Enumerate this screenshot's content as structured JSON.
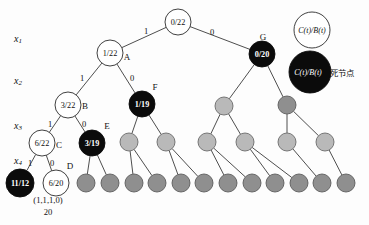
{
  "figure": {
    "axis_labels": [
      {
        "base": "x",
        "sub": "1",
        "x": 18,
        "y": 38
      },
      {
        "base": "x",
        "sub": "2",
        "x": 18,
        "y": 80
      },
      {
        "base": "x",
        "sub": "3",
        "x": 18,
        "y": 125
      },
      {
        "base": "x",
        "sub": "4",
        "x": 18,
        "y": 160
      }
    ],
    "caption_lines": [
      {
        "text": "(1,1,1,0)",
        "x": 48,
        "y": 200
      },
      {
        "text": "20",
        "x": 48,
        "y": 212
      }
    ],
    "legend": {
      "live_node": {
        "label": "C(t)/B(t)",
        "cx": 312,
        "cy": 30,
        "r": 18,
        "style": "white"
      },
      "dead_node": {
        "label": "C(t)/B(t)",
        "suffix": "死节点",
        "cx": 310,
        "cy": 72,
        "r": 21,
        "style": "black"
      }
    },
    "colors": {
      "white_node": "#ffffff",
      "black_node": "#0b0b0b",
      "gray_light": "#b9b9b9",
      "gray_dark": "#8f8f8f",
      "stroke": "#2b2b2b",
      "background": "#fdfdfd"
    }
  },
  "nodes": [
    {
      "id": "root",
      "label": "0/22",
      "tag": "",
      "style": "white",
      "cx": 178,
      "cy": 22,
      "r": 13,
      "tag_dx": 0,
      "tag_dy": 0
    },
    {
      "id": "A",
      "label": "1/22",
      "tag": "A",
      "style": "white",
      "cx": 110,
      "cy": 53,
      "r": 13,
      "tag_dx": 17,
      "tag_dy": 4
    },
    {
      "id": "G",
      "label": "0/20",
      "tag": "G",
      "style": "black",
      "cx": 262,
      "cy": 54,
      "r": 13,
      "tag_dx": 1,
      "tag_dy": -17
    },
    {
      "id": "B",
      "label": "3/22",
      "tag": "B",
      "style": "white",
      "cx": 68,
      "cy": 105,
      "r": 13,
      "tag_dx": 17,
      "tag_dy": 1
    },
    {
      "id": "F",
      "label": "1/19",
      "tag": "F",
      "style": "black",
      "cx": 142,
      "cy": 104,
      "r": 13,
      "tag_dx": 13,
      "tag_dy": -17
    },
    {
      "id": "g2a",
      "label": "",
      "tag": "",
      "style": "gray-light",
      "cx": 224,
      "cy": 106,
      "r": 9,
      "tag_dx": 0,
      "tag_dy": 0
    },
    {
      "id": "g2b",
      "label": "",
      "tag": "",
      "style": "gray-dark",
      "cx": 287,
      "cy": 105,
      "r": 9,
      "tag_dx": 0,
      "tag_dy": 0
    },
    {
      "id": "C",
      "label": "6/22",
      "tag": "C",
      "style": "white",
      "cx": 42,
      "cy": 143,
      "r": 13,
      "tag_dx": 17,
      "tag_dy": 2
    },
    {
      "id": "E",
      "label": "3/19",
      "tag": "E",
      "style": "black",
      "cx": 92,
      "cy": 143,
      "r": 13,
      "tag_dx": 15,
      "tag_dy": -17
    },
    {
      "id": "g3a",
      "label": "",
      "tag": "",
      "style": "gray-light",
      "cx": 129,
      "cy": 142,
      "r": 9,
      "tag_dx": 0,
      "tag_dy": 0
    },
    {
      "id": "g3b",
      "label": "",
      "tag": "",
      "style": "gray-light",
      "cx": 166,
      "cy": 142,
      "r": 9,
      "tag_dx": 0,
      "tag_dy": 0
    },
    {
      "id": "g3c",
      "label": "",
      "tag": "",
      "style": "gray-light",
      "cx": 207,
      "cy": 142,
      "r": 9,
      "tag_dx": 0,
      "tag_dy": 0
    },
    {
      "id": "g3d",
      "label": "",
      "tag": "",
      "style": "gray-light",
      "cx": 245,
      "cy": 142,
      "r": 9,
      "tag_dx": 0,
      "tag_dy": 0
    },
    {
      "id": "g3e",
      "label": "",
      "tag": "",
      "style": "gray-light",
      "cx": 287,
      "cy": 142,
      "r": 9,
      "tag_dx": 0,
      "tag_dy": 0
    },
    {
      "id": "g3f",
      "label": "",
      "tag": "",
      "style": "gray-light",
      "cx": 325,
      "cy": 142,
      "r": 9,
      "tag_dx": 0,
      "tag_dy": 0
    },
    {
      "id": "H",
      "label": "11/12",
      "tag": "",
      "style": "black",
      "cx": 20,
      "cy": 183,
      "r": 14,
      "tag_dx": 0,
      "tag_dy": 0
    },
    {
      "id": "D",
      "label": "6/20",
      "tag": "D",
      "style": "white",
      "cx": 56,
      "cy": 183,
      "r": 13,
      "tag_dx": 14,
      "tag_dy": -17
    },
    {
      "id": "l1",
      "label": "",
      "tag": "",
      "style": "gray-dark",
      "cx": 86,
      "cy": 183,
      "r": 9,
      "tag_dx": 0,
      "tag_dy": 0
    },
    {
      "id": "l2",
      "label": "",
      "tag": "",
      "style": "gray-dark",
      "cx": 110,
      "cy": 183,
      "r": 9,
      "tag_dx": 0,
      "tag_dy": 0
    },
    {
      "id": "l3",
      "label": "",
      "tag": "",
      "style": "gray-dark",
      "cx": 134,
      "cy": 183,
      "r": 9,
      "tag_dx": 0,
      "tag_dy": 0
    },
    {
      "id": "l4",
      "label": "",
      "tag": "",
      "style": "gray-dark",
      "cx": 157,
      "cy": 183,
      "r": 9,
      "tag_dx": 0,
      "tag_dy": 0
    },
    {
      "id": "l5",
      "label": "",
      "tag": "",
      "style": "gray-dark",
      "cx": 181,
      "cy": 183,
      "r": 9,
      "tag_dx": 0,
      "tag_dy": 0
    },
    {
      "id": "l6",
      "label": "",
      "tag": "",
      "style": "gray-dark",
      "cx": 204,
      "cy": 183,
      "r": 9,
      "tag_dx": 0,
      "tag_dy": 0
    },
    {
      "id": "l7",
      "label": "",
      "tag": "",
      "style": "gray-dark",
      "cx": 228,
      "cy": 183,
      "r": 9,
      "tag_dx": 0,
      "tag_dy": 0
    },
    {
      "id": "l8",
      "label": "",
      "tag": "",
      "style": "gray-dark",
      "cx": 252,
      "cy": 183,
      "r": 9,
      "tag_dx": 0,
      "tag_dy": 0
    },
    {
      "id": "l9",
      "label": "",
      "tag": "",
      "style": "gray-dark",
      "cx": 275,
      "cy": 183,
      "r": 9,
      "tag_dx": 0,
      "tag_dy": 0
    },
    {
      "id": "l10",
      "label": "",
      "tag": "",
      "style": "gray-dark",
      "cx": 299,
      "cy": 183,
      "r": 9,
      "tag_dx": 0,
      "tag_dy": 0
    },
    {
      "id": "l11",
      "label": "",
      "tag": "",
      "style": "gray-dark",
      "cx": 322,
      "cy": 183,
      "r": 9,
      "tag_dx": 0,
      "tag_dy": 0
    },
    {
      "id": "l12",
      "label": "",
      "tag": "",
      "style": "gray-dark",
      "cx": 346,
      "cy": 183,
      "r": 9,
      "tag_dx": 0,
      "tag_dy": 0
    }
  ],
  "edges": [
    {
      "from": "root",
      "to": "A",
      "label": "1",
      "lx": 146,
      "ly": 31
    },
    {
      "from": "root",
      "to": "G",
      "label": "0",
      "lx": 212,
      "ly": 32
    },
    {
      "from": "A",
      "to": "B",
      "label": "1",
      "lx": 82,
      "ly": 78
    },
    {
      "from": "A",
      "to": "F",
      "label": "0",
      "lx": 132,
      "ly": 78
    },
    {
      "from": "G",
      "to": "g2a",
      "label": "",
      "lx": 0,
      "ly": 0
    },
    {
      "from": "G",
      "to": "g2b",
      "label": "",
      "lx": 0,
      "ly": 0
    },
    {
      "from": "B",
      "to": "C",
      "label": "1",
      "lx": 50,
      "ly": 124
    },
    {
      "from": "B",
      "to": "E",
      "label": "0",
      "lx": 84,
      "ly": 124
    },
    {
      "from": "F",
      "to": "g3a",
      "label": "",
      "lx": 0,
      "ly": 0
    },
    {
      "from": "F",
      "to": "g3b",
      "label": "",
      "lx": 0,
      "ly": 0
    },
    {
      "from": "g2a",
      "to": "g3c",
      "label": "",
      "lx": 0,
      "ly": 0
    },
    {
      "from": "g2a",
      "to": "g3d",
      "label": "",
      "lx": 0,
      "ly": 0
    },
    {
      "from": "g2b",
      "to": "g3e",
      "label": "",
      "lx": 0,
      "ly": 0
    },
    {
      "from": "g2b",
      "to": "g3f",
      "label": "",
      "lx": 0,
      "ly": 0
    },
    {
      "from": "C",
      "to": "H",
      "label": "1",
      "lx": 30,
      "ly": 163
    },
    {
      "from": "C",
      "to": "D",
      "label": "0",
      "lx": 52,
      "ly": 163
    },
    {
      "from": "E",
      "to": "l1",
      "label": "",
      "lx": 0,
      "ly": 0
    },
    {
      "from": "E",
      "to": "l2",
      "label": "",
      "lx": 0,
      "ly": 0
    },
    {
      "from": "g3a",
      "to": "l3",
      "label": "",
      "lx": 0,
      "ly": 0
    },
    {
      "from": "g3a",
      "to": "l4",
      "label": "",
      "lx": 0,
      "ly": 0
    },
    {
      "from": "g3b",
      "to": "l5",
      "label": "",
      "lx": 0,
      "ly": 0
    },
    {
      "from": "g3b",
      "to": "l6",
      "label": "",
      "lx": 0,
      "ly": 0
    },
    {
      "from": "g3c",
      "to": "l7",
      "label": "",
      "lx": 0,
      "ly": 0
    },
    {
      "from": "g3c",
      "to": "l8",
      "label": "",
      "lx": 0,
      "ly": 0
    },
    {
      "from": "g3d",
      "to": "l9",
      "label": "",
      "lx": 0,
      "ly": 0
    },
    {
      "from": "g3d",
      "to": "l10",
      "label": "",
      "lx": 0,
      "ly": 0
    },
    {
      "from": "g3e",
      "to": "l11",
      "label": "",
      "lx": 0,
      "ly": 0
    },
    {
      "from": "g3f",
      "to": "l12",
      "label": "",
      "lx": 0,
      "ly": 0
    }
  ]
}
